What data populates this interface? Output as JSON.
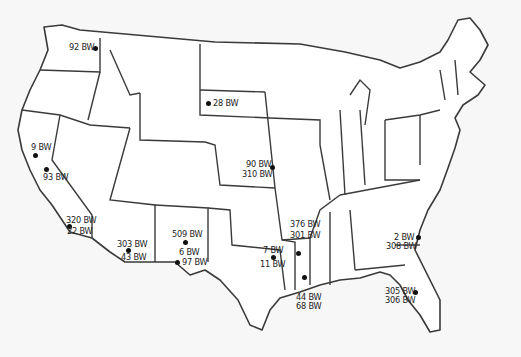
{
  "map": {
    "type": "outline map of the contiguous United States with state borders",
    "colors": {
      "background": "#f7f7f7",
      "land": "#ffffff",
      "border": "#3a3a3a",
      "marker": "#111111"
    },
    "markers": [
      {
        "id": "wa",
        "labels": [
          "92 BW"
        ],
        "dot": [
          95,
          48
        ],
        "text": [
          [
            69,
            43
          ]
        ]
      },
      {
        "id": "sd",
        "labels": [
          "28 BW"
        ],
        "dot": [
          208,
          103
        ],
        "text": [
          [
            213,
            99
          ]
        ]
      },
      {
        "id": "ca-north",
        "labels": [
          "9 BW"
        ],
        "dot": [
          35,
          155
        ],
        "text": [
          [
            31,
            143
          ]
        ]
      },
      {
        "id": "ca-central",
        "labels": [
          "93 BW"
        ],
        "dot": [
          46,
          169
        ],
        "text": [
          [
            43,
            173
          ]
        ]
      },
      {
        "id": "ca-south",
        "labels": [
          "320 BW",
          "22 BW"
        ],
        "dot": [
          69,
          226
        ],
        "text": [
          [
            66,
            216
          ],
          [
            67,
            227
          ]
        ]
      },
      {
        "id": "az",
        "labels": [
          "303 BW",
          "43 BW"
        ],
        "dot": [
          128,
          250
        ],
        "text": [
          [
            117,
            240
          ],
          [
            121,
            253
          ]
        ]
      },
      {
        "id": "nm",
        "labels": [
          "509 BW",
          "6 BW"
        ],
        "dot": [
          185,
          242
        ],
        "text": [
          [
            172,
            230
          ],
          [
            179,
            248
          ]
        ]
      },
      {
        "id": "tx-west",
        "labels": [
          "97 BW"
        ],
        "dot": [
          177,
          262
        ],
        "text": [
          [
            182,
            258
          ]
        ]
      },
      {
        "id": "ks-mo",
        "labels": [
          "90 BW",
          "310 BW"
        ],
        "dot": [
          272,
          167
        ],
        "text": [
          [
            246,
            160
          ],
          [
            242,
            170
          ]
        ]
      },
      {
        "id": "tx-east",
        "labels": [
          "7 BW",
          "11 BW"
        ],
        "dot": [
          297,
          257
        ],
        "text": [
          [
            290,
            246
          ],
          [
            288,
            260
          ]
        ]
      },
      {
        "id": "la-north",
        "labels": [
          "376 BW",
          "301 BW"
        ],
        "dot": [
          298,
          253
        ],
        "text": [
          [
            290,
            220
          ],
          [
            290,
            231
          ]
        ]
      },
      {
        "id": "la-south",
        "labels": [
          "44 BW",
          "68 BW"
        ],
        "dot": [
          304,
          277
        ],
        "text": [
          [
            296,
            293
          ],
          [
            296,
            302
          ]
        ]
      },
      {
        "id": "ga-sc",
        "labels": [
          "2 BW",
          "308 BW"
        ],
        "dot": [
          418,
          237
        ],
        "text": [
          [
            394,
            233
          ],
          [
            386,
            242
          ]
        ]
      },
      {
        "id": "fl",
        "labels": [
          "305 BW",
          "306 BW"
        ],
        "dot": [
          415,
          292
        ],
        "text": [
          [
            385,
            287
          ],
          [
            385,
            296
          ]
        ]
      }
    ]
  }
}
